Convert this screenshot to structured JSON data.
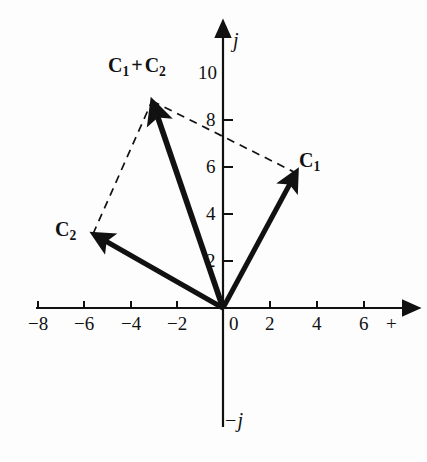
{
  "figure": {
    "type": "vector-diagram",
    "background_color": "#fdfdfd",
    "ink_color": "#111111",
    "width": 427,
    "height": 462
  },
  "axes": {
    "origin_px": [
      223,
      308
    ],
    "px_per_unit": 23.4,
    "x_axis": {
      "name": "+",
      "name_px": [
        392,
        322
      ],
      "line_px": [
        36,
        308,
        408,
        308
      ],
      "arrow_end": "right",
      "ticks": [
        {
          "label": "−8",
          "value": -8,
          "x_px": 38
        },
        {
          "label": "−6",
          "value": -6,
          "x_px": 84
        },
        {
          "label": "−4",
          "value": -4,
          "x_px": 131
        },
        {
          "label": "−2",
          "value": -2,
          "x_px": 177
        },
        {
          "label": "0",
          "value": 0,
          "x_px": 223
        },
        {
          "label": "2",
          "value": 2,
          "x_px": 270
        },
        {
          "label": "4",
          "value": 4,
          "x_px": 317
        },
        {
          "label": "6",
          "value": 6,
          "x_px": 364
        }
      ]
    },
    "y_axis": {
      "name": "j",
      "name_px": [
        233,
        40
      ],
      "negative_name": "−j",
      "negative_name_px": [
        228,
        421
      ],
      "line_px": [
        223,
        32,
        223,
        427
      ],
      "arrow_end": "top",
      "ticks": [
        {
          "label": "10",
          "value": 10,
          "y_px": 73
        },
        {
          "label": "8",
          "value": 8,
          "y_px": 120
        },
        {
          "label": "6",
          "value": 6,
          "y_px": 167
        },
        {
          "label": "4",
          "value": 4,
          "y_px": 214
        },
        {
          "label": "2",
          "value": 2,
          "y_px": 261
        }
      ]
    }
  },
  "vectors": [
    {
      "id": "c1",
      "label": "C",
      "subscript": "1",
      "label_px": [
        305,
        160
      ],
      "from_px": [
        223,
        308
      ],
      "to_px": [
        296,
        173
      ],
      "components": [
        3,
        5.8
      ],
      "style": "solid",
      "stroke_width": 5
    },
    {
      "id": "c2",
      "label": "C",
      "subscript": "2",
      "label_px": [
        58,
        228
      ],
      "from_px": [
        223,
        308
      ],
      "to_px": [
        93,
        234
      ],
      "components": [
        -5.6,
        3.2
      ],
      "style": "solid",
      "stroke_width": 5
    },
    {
      "id": "c1-plus-c2",
      "label": "C",
      "subscript": "1",
      "label2": "C",
      "subscript2": "2",
      "operator": "+",
      "label_px": [
        110,
        62
      ],
      "from_px": [
        223,
        308
      ],
      "to_px": [
        152,
        101
      ],
      "components": [
        -3.0,
        8.9
      ],
      "style": "solid",
      "stroke_width": 6
    }
  ],
  "construction_lines": [
    {
      "id": "dashed-c2-to-sum",
      "from_px": [
        93,
        234
      ],
      "to_px": [
        152,
        101
      ],
      "style": "dashed"
    },
    {
      "id": "dashed-sum-to-c1",
      "from_px": [
        152,
        101
      ],
      "to_px": [
        296,
        173
      ],
      "style": "dashed"
    }
  ],
  "labels": {
    "c1": "C",
    "c1_sub": "1",
    "c2": "C",
    "c2_sub": "2",
    "plus": "+",
    "j": "j",
    "minus_j": "−j",
    "plus_axis": "+"
  }
}
